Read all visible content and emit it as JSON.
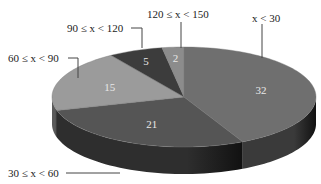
{
  "chart_data": {
    "type": "pie",
    "style": "3d-tilted",
    "title": "",
    "categories": [
      "x < 30",
      "30 ≤ x < 60",
      "60 ≤ x < 90",
      "90 ≤ x < 120",
      "120 ≤ x < 150"
    ],
    "values": [
      32,
      21,
      15,
      5,
      2
    ],
    "value_labels": [
      "32",
      "21",
      "15",
      "5",
      "2"
    ],
    "colors": [
      "#6f6f6f",
      "#555555",
      "#9b9b9b",
      "#3c3c3c",
      "#8c8c8c"
    ],
    "side_colors": [
      "#3a3a3a",
      "#2e2e2e",
      "#5a5a5a",
      "#222222",
      "#4e4e4e"
    ],
    "start_angle_deg": 90,
    "direction": "clockwise",
    "label_mode": "callouts-with-leader-lines",
    "legend": "none"
  }
}
